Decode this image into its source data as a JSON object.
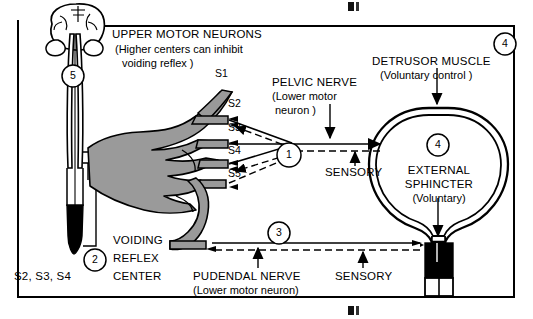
{
  "diagram": {
    "title_blocks": {
      "upper_motor_neurons": {
        "line1": "UPPER MOTOR NEURONS",
        "line2": "(Higher centers can inhibit",
        "line3": "voiding reflex )"
      },
      "pelvic_nerve": {
        "line1": "PELVIC NERVE",
        "line2": "(Lower motor",
        "line3": "neuron )"
      },
      "detrusor_muscle": {
        "line1": "DETRUSOR MUSCLE",
        "line2": "(Voluntary control )"
      },
      "external_sphincter": {
        "line1": "EXTERNAL",
        "line2": "SPHINCTER",
        "line3": "(Voluntary)"
      },
      "voiding_reflex_center": {
        "line1": "VOIDING",
        "line2": "REFLEX",
        "line3": "CENTER",
        "roots": "S2, S3, S4"
      },
      "pudendal_nerve": {
        "line1": "PUDENDAL NERVE",
        "line2": "(Lower motor neuron)"
      }
    },
    "sensory_labels": {
      "pelvic": "SENSORY",
      "pudendal": "SENSORY"
    },
    "sacral_roots": [
      "S1",
      "S2",
      "S3",
      "S4",
      "S5"
    ],
    "markers": [
      {
        "id": "marker-1",
        "label": "1"
      },
      {
        "id": "marker-2",
        "label": "2"
      },
      {
        "id": "marker-3",
        "label": "3"
      },
      {
        "id": "marker-4-bladder",
        "label": "4"
      },
      {
        "id": "marker-4-corner",
        "label": "4"
      },
      {
        "id": "marker-5",
        "label": "5"
      }
    ],
    "colors": {
      "ink": "#000000",
      "nerve_gray": "#9a9a9a",
      "nerve_gray_light": "#b3b3b3",
      "background": "#ffffff"
    }
  }
}
